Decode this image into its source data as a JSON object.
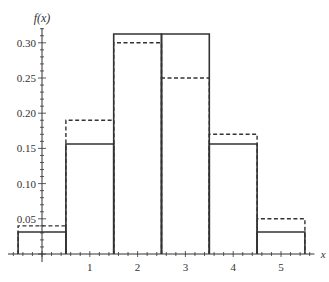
{
  "chart_data": {
    "type": "bar",
    "title": "",
    "xlabel": "x",
    "ylabel": "f(x)",
    "categories": [
      0,
      1,
      2,
      3,
      4,
      5
    ],
    "series": [
      {
        "name": "solid",
        "style": "solid",
        "values": [
          0.03125,
          0.15625,
          0.3125,
          0.3125,
          0.15625,
          0.03125
        ]
      },
      {
        "name": "dashed",
        "style": "dashed",
        "values": [
          0.04,
          0.19,
          0.3,
          0.25,
          0.17,
          0.05
        ]
      }
    ],
    "xticks": [
      "1",
      "2",
      "3",
      "4",
      "5"
    ],
    "yticks": [
      "0.05",
      "0.10",
      "0.15",
      "0.20",
      "0.25",
      "0.30"
    ],
    "ylim": [
      0,
      0.32
    ],
    "grid": false,
    "legend": "none"
  }
}
